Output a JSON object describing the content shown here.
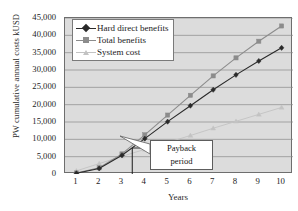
{
  "chart_data": {
    "type": "line",
    "title": "",
    "xlabel": "Years",
    "ylabel": "PW cumulative annual costs kUSD",
    "x": [
      1,
      2,
      3,
      4,
      5,
      6,
      7,
      8,
      9,
      10
    ],
    "xlim": [
      0.5,
      10.5
    ],
    "ylim": [
      0,
      45000
    ],
    "ytick_values": [
      0,
      5000,
      10000,
      15000,
      20000,
      25000,
      30000,
      35000,
      40000,
      45000
    ],
    "ytick_labels": [
      "0",
      "5,000",
      "10,000",
      "15,000",
      "20,000",
      "25,000",
      "30,000",
      "35,000",
      "40,000",
      "45,000"
    ],
    "xtick_labels": [
      "1",
      "2",
      "3",
      "4",
      "5",
      "6",
      "7",
      "8",
      "9",
      "10"
    ],
    "grid": "horizontal",
    "legend_position": "top-left",
    "plot_background": "#dcdcdc",
    "series": [
      {
        "name": "Hard direct benefits",
        "color": "#2a2a2a",
        "marker": "diamond",
        "values": [
          200,
          1600,
          5400,
          10200,
          15100,
          19700,
          24300,
          28600,
          32600,
          36400
        ]
      },
      {
        "name": "Total benefits",
        "color": "#8c8c8c",
        "marker": "square",
        "values": [
          300,
          1800,
          5800,
          11300,
          17000,
          22700,
          28300,
          33500,
          38300,
          42700
        ]
      },
      {
        "name": "System cost",
        "color": "#c3c3c3",
        "marker": "triangle",
        "values": [
          900,
          3000,
          5100,
          7100,
          9100,
          11100,
          13200,
          15200,
          17200,
          19200
        ]
      }
    ],
    "annotations": [
      {
        "name": "payback-period",
        "label_line1": "Payback",
        "label_line2": "period",
        "x_value": 3.45,
        "marker_type": "vertical-line-with-callout"
      }
    ]
  }
}
